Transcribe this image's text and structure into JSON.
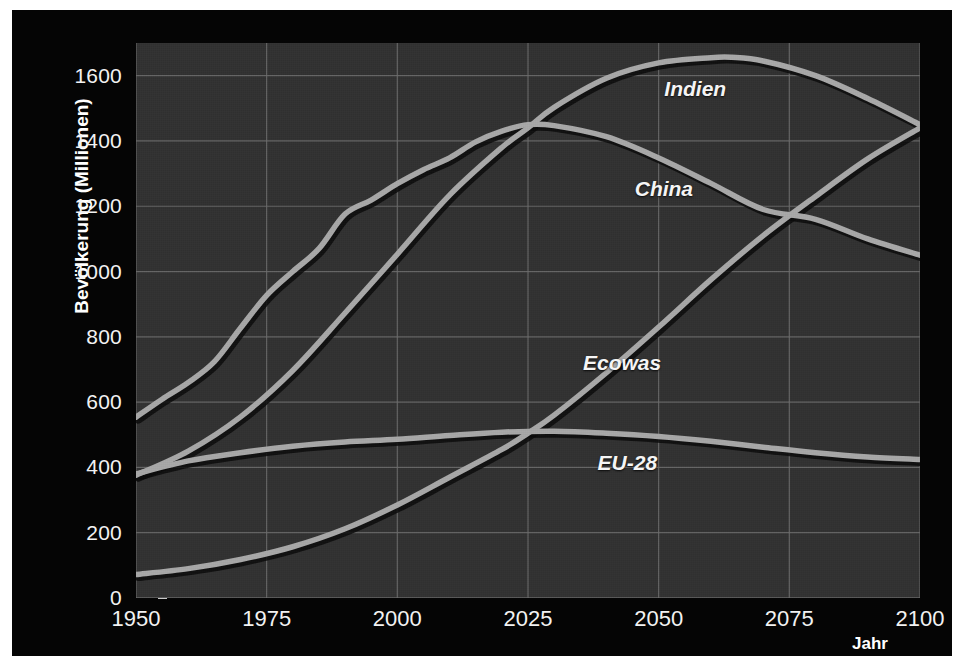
{
  "chart_data": {
    "type": "line",
    "title": "",
    "xlabel": "Jahr",
    "ylabel": "Bevölkerung (Millionen)",
    "xlim": [
      1950,
      2100
    ],
    "ylim": [
      0,
      1700
    ],
    "grid": true,
    "legend_position": "inline-labels",
    "background_color": "#313131",
    "panel_color": "#050505",
    "line_color": "#a8a8a8",
    "grid_color": "#6e6e6e",
    "text_color": "#f2f2f2",
    "x_ticks": [
      1950,
      1975,
      2000,
      2025,
      2050,
      2075,
      2100
    ],
    "x_tick_labels": [
      "1950",
      "1975",
      "2000",
      "2025",
      "2050",
      "2075",
      "2100"
    ],
    "y_ticks": [
      0,
      200,
      400,
      600,
      800,
      1000,
      1200,
      1400,
      1600
    ],
    "y_tick_labels": [
      "0",
      "200",
      "400",
      "600",
      "800",
      "1000",
      "1200",
      "1400",
      "1600"
    ],
    "series": [
      {
        "name": "Indien",
        "label_x": 2057,
        "label_y": 1560,
        "x": [
          1950,
          1960,
          1970,
          1980,
          1990,
          2000,
          2010,
          2020,
          2025,
          2030,
          2040,
          2050,
          2060,
          2064,
          2070,
          2080,
          2090,
          2100
        ],
        "values": [
          376,
          450,
          555,
          697,
          873,
          1053,
          1234,
          1380,
          1440,
          1503,
          1592,
          1639,
          1655,
          1656,
          1645,
          1600,
          1530,
          1450
        ]
      },
      {
        "name": "China",
        "label_x": 2051,
        "label_y": 1253,
        "x": [
          1950,
          1955,
          1960,
          1965,
          1970,
          1975,
          1980,
          1985,
          1990,
          1995,
          2000,
          2005,
          2010,
          2015,
          2020,
          2025,
          2030,
          2040,
          2050,
          2060,
          2070,
          2080,
          2090,
          2100
        ],
        "values": [
          554,
          609,
          660,
          724,
          827,
          927,
          1000,
          1070,
          1176,
          1219,
          1269,
          1312,
          1348,
          1397,
          1430,
          1450,
          1447,
          1413,
          1348,
          1270,
          1190,
          1160,
          1100,
          1050
        ]
      },
      {
        "name": "Ecowas",
        "label_x": 2043,
        "label_y": 720,
        "x": [
          1950,
          1960,
          1970,
          1980,
          1990,
          2000,
          2010,
          2020,
          2025,
          2030,
          2040,
          2050,
          2060,
          2070,
          2080,
          2090,
          2100
        ],
        "values": [
          72,
          90,
          118,
          157,
          212,
          285,
          370,
          455,
          505,
          560,
          690,
          830,
          975,
          1110,
          1230,
          1345,
          1440
        ]
      },
      {
        "name": "EU-28",
        "label_x": 2044,
        "label_y": 412,
        "x": [
          1950,
          1960,
          1970,
          1980,
          1990,
          2000,
          2010,
          2020,
          2030,
          2040,
          2050,
          2060,
          2070,
          2080,
          2090,
          2100
        ],
        "values": [
          380,
          420,
          445,
          465,
          478,
          486,
          498,
          508,
          511,
          505,
          495,
          480,
          462,
          445,
          432,
          424
        ]
      }
    ]
  }
}
